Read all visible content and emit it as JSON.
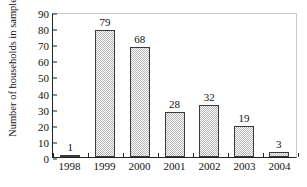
{
  "chart_data": {
    "type": "bar",
    "title": "",
    "xlabel": "",
    "ylabel": "Number of households in sample",
    "categories": [
      "1998",
      "1999",
      "2000",
      "2001",
      "2002",
      "2003",
      "2004"
    ],
    "values": [
      1,
      79,
      68,
      28,
      32,
      19,
      3
    ],
    "value_labels": [
      "1",
      "79",
      "68",
      "28",
      "32",
      "19",
      "3"
    ],
    "ylim": [
      0,
      90
    ],
    "ytick_labels": [
      "0",
      "10",
      "20",
      "30",
      "40",
      "50",
      "60",
      "70",
      "80",
      "90"
    ],
    "ytick_values": [
      0,
      10,
      20,
      30,
      40,
      50,
      60,
      70,
      80,
      90
    ],
    "grid": false,
    "legend": null,
    "bar_fill": "#b4b4b4",
    "bar_outline": "#3a3a3a",
    "axis_color": "#222222",
    "frame_color": "#c8c8c8",
    "background": "#ffffff"
  }
}
